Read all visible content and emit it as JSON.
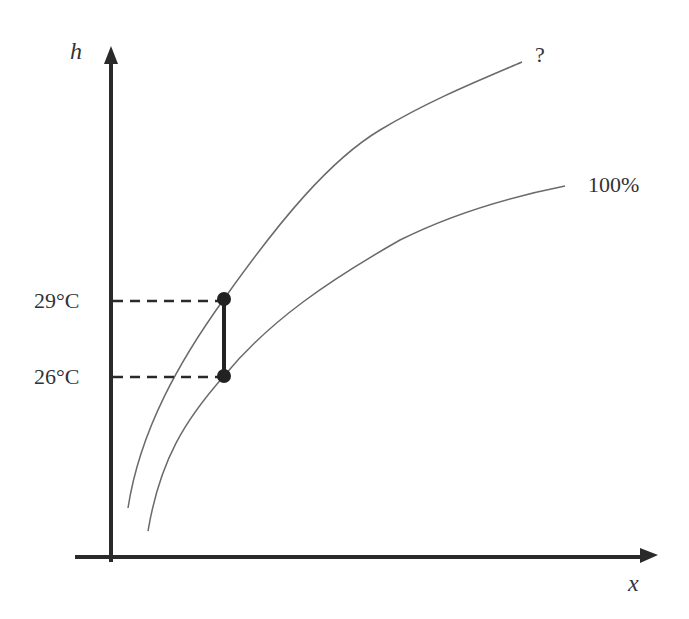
{
  "diagram": {
    "type": "psychrometric-sketch",
    "axes": {
      "y_label": "h",
      "x_label": "x"
    },
    "curves": [
      {
        "name": "unknown-humidity-curve",
        "label": "?"
      },
      {
        "name": "saturation-curve",
        "label": "100%"
      }
    ],
    "points": [
      {
        "label": "29°C",
        "on_curve": "?"
      },
      {
        "label": "26°C",
        "on_curve": "100%"
      }
    ],
    "colors": {
      "axis": "#2a2a2a",
      "curve": "#6a6a6a",
      "text": "#333333",
      "point": "#222222"
    }
  }
}
